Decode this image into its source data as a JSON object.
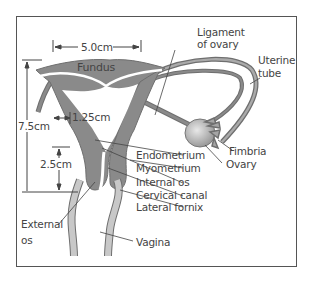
{
  "colors": {
    "tissue": "#8a8a8a",
    "tissue_outline": "#6f6f6f",
    "vagina": "#c8c8c8",
    "ovary": "#b5b5b5",
    "line": "#444444",
    "frame": "#555555",
    "text": "#444444"
  },
  "measurements": {
    "width": "5.0cm",
    "height": "7.5cm",
    "wall": "1.25cm",
    "cervix": "2.5cm"
  },
  "labels": {
    "fundus": "Fundus",
    "ligament_line1": "Ligament",
    "ligament_line2": "of ovary",
    "uterine_tube_line1": "Uterine",
    "uterine_tube_line2": "tube",
    "fimbria": "Fimbria",
    "ovary": "Ovary",
    "endometrium": "Endometrium",
    "myometrium": "Myometrium",
    "internal_os": "Internal os",
    "cervical_canal": "Cervical canal",
    "lateral_fornix": "Lateral fornix",
    "external_os_line1": "External",
    "external_os_line2": "os",
    "vagina": "Vagina"
  }
}
